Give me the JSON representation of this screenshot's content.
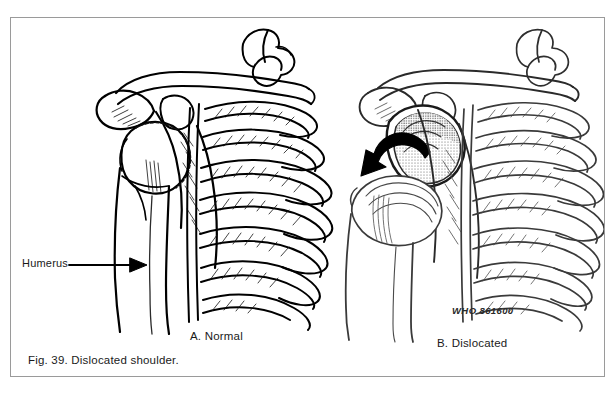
{
  "figure": {
    "caption": "Fig. 39. Dislocated shoulder.",
    "who_code": "WHO 861600",
    "frame_color": "#9a9a9a",
    "background_color": "#ffffff",
    "ink_color": "#000000"
  },
  "panels": [
    {
      "id": "panel-a",
      "label": "A. Normal",
      "description": "Normal shoulder: humeral head seated within the glenoid cavity of the scapula, with clavicle, acromion, coracoid process and rib cage."
    },
    {
      "id": "panel-b",
      "label": "B. Dislocated",
      "description": "Dislocated shoulder: humeral head displaced downward and forward out of the empty glenoid cavity; curved arrow indicates direction of displacement."
    }
  ],
  "annotations": [
    {
      "id": "humerus",
      "label": "Humerus",
      "pointer": "arrow-right",
      "target_panel": "panel-a"
    }
  ],
  "icons": {
    "pointer_arrow": "arrow-right-icon",
    "displacement_arrow": "curved-arrow-icon"
  }
}
